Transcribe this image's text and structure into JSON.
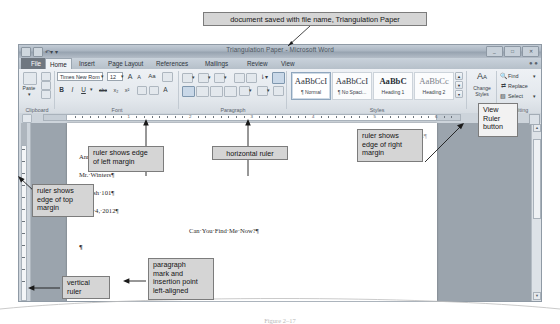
{
  "callouts": {
    "top_title": "document saved with file name, Triangulation Paper",
    "left_margin": "ruler shows edge\nof left margin",
    "horizontal_ruler": "horizontal ruler",
    "right_margin": "ruler shows\nedge of right\nmargin",
    "view_ruler": "View\nRuler\nbutton",
    "top_margin": "ruler shows\nedge of top\nmargin",
    "vertical_ruler": "vertical\nruler",
    "paragraph_mark": "paragraph\nmark and\ninsertion point\nleft-aligned"
  },
  "window": {
    "title": "Triangulation Paper - Microsoft Word",
    "quick_access": [
      "save-icon",
      "undo-icon",
      "redo-icon",
      "customize-icon"
    ],
    "controls": [
      "minimize-button",
      "restore-button",
      "close-button"
    ],
    "help": "?"
  },
  "tabs": [
    {
      "label": "File",
      "active": false,
      "kind": "file"
    },
    {
      "label": "Home",
      "active": true,
      "kind": "normal"
    },
    {
      "label": "Insert",
      "active": false,
      "kind": "normal"
    },
    {
      "label": "Page Layout",
      "active": false,
      "kind": "normal"
    },
    {
      "label": "References",
      "active": false,
      "kind": "normal"
    },
    {
      "label": "Mailings",
      "active": false,
      "kind": "normal"
    },
    {
      "label": "Review",
      "active": false,
      "kind": "normal"
    },
    {
      "label": "View",
      "active": false,
      "kind": "normal"
    }
  ],
  "ribbon": {
    "groups": [
      "Clipboard",
      "Font",
      "Paragraph",
      "Styles",
      "Editing"
    ],
    "clipboard": {
      "paste": "Paste",
      "cut": "cut-icon",
      "copy": "copy-icon",
      "format_painter": "format-painter-icon"
    },
    "font": {
      "name": "Times New Rom",
      "size": "12",
      "grow": "A",
      "shrink": "A",
      "change_case": "Aa",
      "clear_format": "clear-formatting-icon",
      "bold": "B",
      "italic": "I",
      "underline": "U",
      "strikethrough": "abc",
      "subscript": "x₂",
      "superscript": "x²",
      "text_effects": "text-effects-icon",
      "highlight": "highlight-icon",
      "font_color": "A"
    },
    "paragraph": {
      "bullets": "bullets-icon",
      "numbering": "numbering-icon",
      "multilevel": "multilevel-icon",
      "decrease_indent": "decrease-indent-icon",
      "increase_indent": "increase-indent-icon",
      "sort": "sort-icon",
      "show_hide": "show-hide-paragraph-icon",
      "align_left": "align-left-icon",
      "align_center": "align-center-icon",
      "align_right": "align-right-icon",
      "justify": "justify-icon",
      "line_spacing": "line-spacing-icon",
      "shading": "shading-icon",
      "borders": "borders-icon"
    },
    "styles": {
      "items": [
        {
          "preview": "AaBbCcI",
          "name": "¶ Normal",
          "selected": true,
          "weight": "normal"
        },
        {
          "preview": "AaBbCcI",
          "name": "¶ No Spaci...",
          "selected": false,
          "weight": "normal"
        },
        {
          "preview": "AaBbC",
          "name": "Heading 1",
          "selected": false,
          "weight": "bold"
        },
        {
          "preview": "AaBbCc",
          "name": "Heading 2",
          "selected": false,
          "weight": "light"
        }
      ],
      "change_styles": "Change\nStyles"
    },
    "editing": {
      "find": "Find",
      "replace": "Replace",
      "select": "Select"
    }
  },
  "ruler": {
    "numbers": [
      "1",
      "2",
      "3",
      "4",
      "5",
      "6"
    ],
    "vertical_numbers": [
      "1",
      "2",
      "3"
    ]
  },
  "document": {
    "header": "Marino 1¶",
    "lines": [
      "Annalisa·Marino¶",
      "Mr.·Winters¶",
      "English·101¶",
      "April·4,·2012¶"
    ],
    "title_line": "Can·You·Find·Me·Now?¶",
    "insertion_mark": "¶"
  },
  "figure": {
    "caption": "Figure 2–17"
  },
  "colors": {
    "callout_fill": "#d5d5d5",
    "callout_border": "#7c7c7c",
    "window_chrome": "#b6c0ca",
    "page_white": "#ffffff",
    "doc_background": "#9ba4ad"
  }
}
